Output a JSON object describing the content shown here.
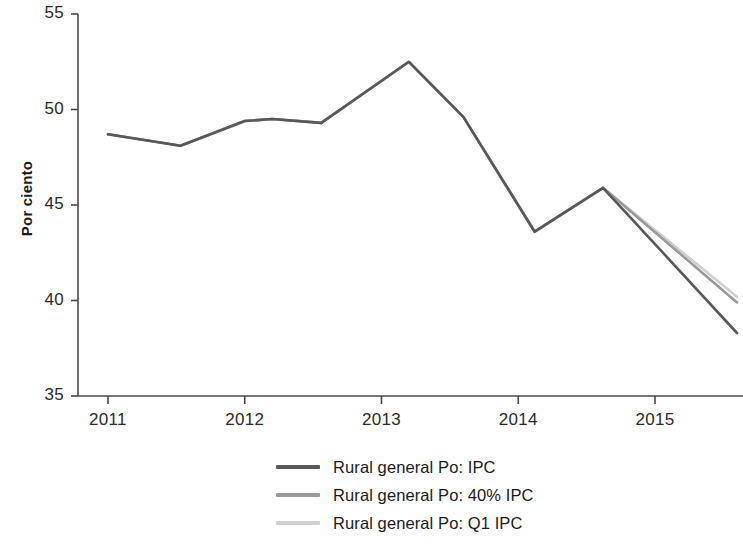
{
  "axis": {
    "ylabel": "Por ciento",
    "yticks": [
      "35",
      "40",
      "45",
      "50",
      "55"
    ],
    "xticks": [
      "2011",
      "2012",
      "2013",
      "2014",
      "2015"
    ]
  },
  "legend": {
    "items": [
      {
        "label": "Rural general Po: IPC",
        "color": "#595959",
        "name": "legend-item-ipc"
      },
      {
        "label": "Rural general Po: 40% IPC",
        "color": "#9a9a9a",
        "name": "legend-item-40-ipc"
      },
      {
        "label": "Rural general Po: Q1 IPC",
        "color": "#d0d0d0",
        "name": "legend-item-q1-ipc"
      }
    ]
  },
  "chart_data": {
    "type": "line",
    "title": "",
    "xlabel": "",
    "ylabel": "Por ciento",
    "xlim": [
      2010.8,
      2015.65
    ],
    "ylim": [
      35,
      55
    ],
    "yticks": [
      35,
      40,
      45,
      50,
      55
    ],
    "xticks": [
      2011,
      2012,
      2013,
      2014,
      2015
    ],
    "grid": false,
    "legend_position": "bottom-center",
    "series": [
      {
        "name": "Rural general Po: IPC",
        "color": "#595959",
        "x": [
          2011.0,
          2011.53,
          2012.0,
          2012.2,
          2012.56,
          2013.2,
          2013.6,
          2014.12,
          2014.62,
          2015.6
        ],
        "values": [
          48.7,
          48.1,
          49.4,
          49.5,
          49.3,
          52.5,
          49.6,
          43.6,
          45.9,
          38.3
        ]
      },
      {
        "name": "Rural general Po: 40% IPC",
        "color": "#9a9a9a",
        "x": [
          2011.0,
          2011.53,
          2012.0,
          2012.2,
          2012.56,
          2013.2,
          2013.6,
          2014.12,
          2014.62,
          2015.6
        ],
        "values": [
          48.7,
          48.1,
          49.4,
          49.5,
          49.3,
          52.5,
          49.6,
          43.6,
          45.9,
          39.9
        ]
      },
      {
        "name": "Rural general Po: Q1 IPC",
        "color": "#d0d0d0",
        "x": [
          2011.0,
          2011.53,
          2012.0,
          2012.2,
          2012.56,
          2013.2,
          2013.6,
          2014.12,
          2014.62,
          2015.6
        ],
        "values": [
          48.7,
          48.1,
          49.4,
          49.5,
          49.3,
          52.5,
          49.6,
          43.6,
          45.9,
          40.2
        ]
      }
    ]
  }
}
